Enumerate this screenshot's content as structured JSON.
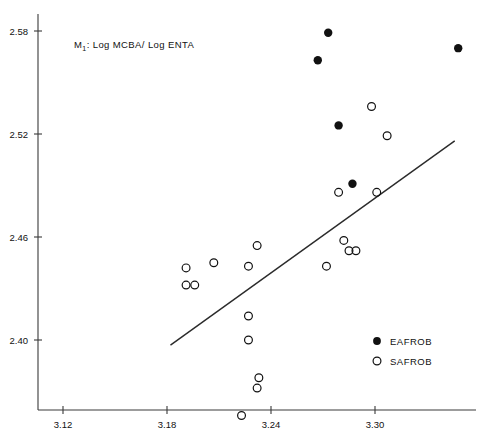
{
  "chart_data": {
    "type": "scatter",
    "title": "",
    "annotation": "M₁: Log MCBA/ Log ENTA",
    "annotation_main": ": Log MCBA/ Log ENTA",
    "annotation_symbol": "M",
    "annotation_subscript": "1",
    "xlabel": "",
    "ylabel": "",
    "xlim": [
      3.105,
      3.345
    ],
    "ylim": [
      2.372,
      2.593
    ],
    "xticks": [
      3.12,
      3.18,
      3.24,
      3.3
    ],
    "xtick_labels": [
      "3.12",
      "3.18",
      "3.24",
      "3.30"
    ],
    "yticks": [
      2.4,
      2.46,
      2.52,
      2.58
    ],
    "ytick_labels": [
      "2.40",
      "2.46",
      "2.52",
      "2.58"
    ],
    "grid": false,
    "legend_position": "bottom-right",
    "series": [
      {
        "name": "EAFROB",
        "marker": "filled-circle",
        "color": "#111111",
        "points": [
          {
            "x": 3.273,
            "y": 2.579
          },
          {
            "x": 3.267,
            "y": 2.563
          },
          {
            "x": 3.279,
            "y": 2.525
          },
          {
            "x": 3.287,
            "y": 2.491
          },
          {
            "x": 3.348,
            "y": 2.57
          }
        ]
      },
      {
        "name": "SAFROB",
        "marker": "open-circle",
        "color": "#111111",
        "points": [
          {
            "x": 3.298,
            "y": 2.536
          },
          {
            "x": 3.307,
            "y": 2.519
          },
          {
            "x": 3.279,
            "y": 2.486
          },
          {
            "x": 3.301,
            "y": 2.486
          },
          {
            "x": 3.232,
            "y": 2.455
          },
          {
            "x": 3.282,
            "y": 2.458
          },
          {
            "x": 3.285,
            "y": 2.452
          },
          {
            "x": 3.289,
            "y": 2.452
          },
          {
            "x": 3.191,
            "y": 2.442
          },
          {
            "x": 3.207,
            "y": 2.445
          },
          {
            "x": 3.227,
            "y": 2.443
          },
          {
            "x": 3.191,
            "y": 2.432
          },
          {
            "x": 3.196,
            "y": 2.432
          },
          {
            "x": 3.272,
            "y": 2.443
          },
          {
            "x": 3.227,
            "y": 2.414
          },
          {
            "x": 3.227,
            "y": 2.4
          },
          {
            "x": 3.233,
            "y": 2.378
          },
          {
            "x": 3.232,
            "y": 2.372
          },
          {
            "x": 3.223,
            "y": 2.356
          }
        ]
      }
    ],
    "trendline": {
      "name": "regression-line",
      "x0": 3.182,
      "y0": 2.397,
      "x1": 3.346,
      "y1": 2.516
    }
  },
  "legend": {
    "items": [
      {
        "label": "EAFROB",
        "marker": "filled-circle"
      },
      {
        "label": "SAFROB",
        "marker": "open-circle"
      }
    ]
  },
  "colors": {
    "axis": "#3a3a3a",
    "marker": "#111111",
    "line": "#2b2b2b",
    "background": "#ffffff"
  }
}
